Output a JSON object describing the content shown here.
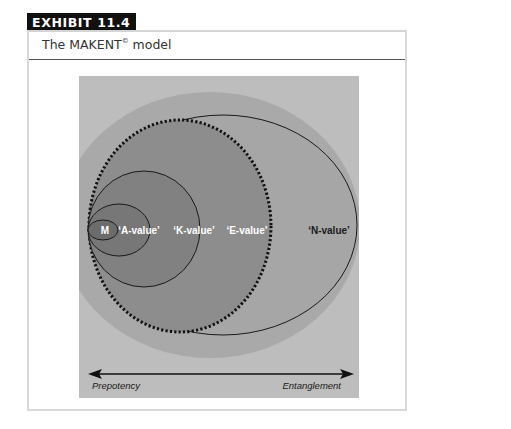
{
  "exhibit": {
    "label": "EXHIBIT 11.4",
    "caption_prefix": "The MAKENT",
    "caption_mark": "©",
    "caption_suffix": " model"
  },
  "diagram": {
    "type": "nested-ellipses",
    "colors": {
      "background": "#bdbdbd",
      "t_region": "#a9a9a9",
      "n_region": "#a4a4a4",
      "e_region": "#8b8b8b",
      "k_region": "#808080",
      "a_region": "#767676",
      "m_region": "#6c6c6c",
      "outline": "#1a1a1a"
    },
    "regions": [
      {
        "id": "M",
        "label": "M",
        "text_color": "#ffffff"
      },
      {
        "id": "A",
        "label": "‘A-value’",
        "text_color": "#ffffff"
      },
      {
        "id": "K",
        "label": "‘K-value’",
        "text_color": "#ffffff"
      },
      {
        "id": "E",
        "label": "‘E-value’",
        "text_color": "#ffffff"
      },
      {
        "id": "N",
        "label": "‘N-value’",
        "text_color": "#1a1a1a"
      },
      {
        "id": "T",
        "label": "‘T-value’",
        "text_color": "#1a1a1a"
      }
    ],
    "axis": {
      "left_label": "Prepotency",
      "right_label": "Entanglement"
    }
  }
}
